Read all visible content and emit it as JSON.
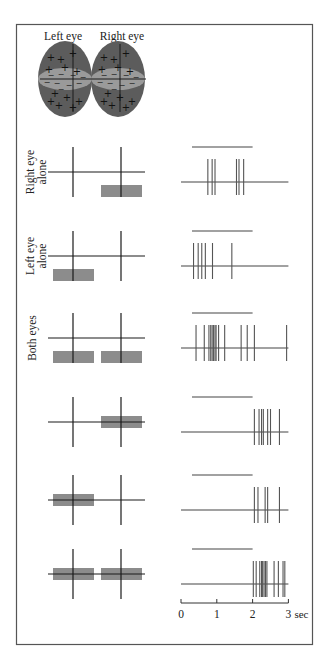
{
  "figure": {
    "eye_labels": {
      "left": "Left eye",
      "right": "Right eye"
    },
    "eye_field_symbols": {
      "excitatory": "+",
      "inhibitory": "−"
    },
    "colors": {
      "frame": "#555555",
      "line": "#1a1a1a",
      "eye_outer": "#5c5c5c",
      "eye_inner": "#9a9a9a",
      "stimulus_bar": "#8c8c8c",
      "spike": "#555555"
    },
    "row_labels": [
      "Right eye alone",
      "Left eye alone",
      "Both eyes",
      "",
      "",
      ""
    ],
    "rows": [
      {
        "label_lines": [
          "Right eye",
          "alone"
        ],
        "stim_left": null,
        "stim_right": "below",
        "spikes": [
          0.75,
          0.87,
          0.95,
          1.55,
          1.62,
          1.75
        ]
      },
      {
        "label_lines": [
          "Left eye",
          "alone"
        ],
        "stim_left": "below",
        "stim_right": null,
        "spikes": [
          0.35,
          0.48,
          0.58,
          0.68,
          0.88,
          1.42
        ]
      },
      {
        "label_lines": [
          "Both eyes"
        ],
        "stim_left": "below",
        "stim_right": "below",
        "spikes": [
          0.42,
          0.65,
          0.78,
          0.83,
          0.87,
          0.91,
          0.95,
          0.98,
          1.05,
          1.22,
          1.68,
          1.85,
          2.05,
          2.95
        ]
      },
      {
        "label_lines": [],
        "stim_left": null,
        "stim_right": "center",
        "spikes": [
          2.05,
          2.18,
          2.25,
          2.3,
          2.42,
          2.5,
          2.75
        ]
      },
      {
        "label_lines": [],
        "stim_left": "center",
        "stim_right": null,
        "spikes": [
          2.05,
          2.15,
          2.35,
          2.42,
          2.75
        ]
      },
      {
        "label_lines": [],
        "stim_left": "center",
        "stim_right": "center",
        "spikes": [
          2.02,
          2.1,
          2.2,
          2.25,
          2.28,
          2.32,
          2.36,
          2.4,
          2.6,
          2.72,
          2.85,
          2.9
        ]
      }
    ],
    "stimulus_period_sec": [
      0.25,
      2.0
    ],
    "time_axis": {
      "ticks": [
        "0",
        "1",
        "2",
        "3"
      ],
      "unit": "sec",
      "max_sec": 3
    }
  }
}
